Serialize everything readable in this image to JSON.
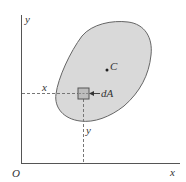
{
  "diagram": {
    "axes": {
      "origin_label": "O",
      "x_axis_label": "x",
      "y_axis_label": "y"
    },
    "region": {
      "fill_color": "#d9d9d9",
      "stroke_color": "#666666"
    },
    "centroid": {
      "label": "C"
    },
    "element": {
      "label": "dA",
      "x_distance_label": "x",
      "y_distance_label": "y"
    }
  }
}
